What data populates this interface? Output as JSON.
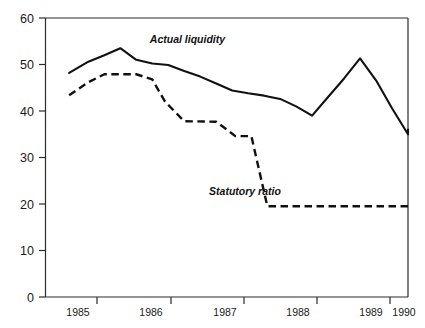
{
  "chart_data": {
    "type": "line",
    "title": "",
    "subtitle": "",
    "xlabel": "",
    "ylabel": "",
    "xlim": [
      1984.33,
      1990.0
    ],
    "ylim": [
      0,
      60
    ],
    "yticks": [
      0,
      10,
      20,
      30,
      40,
      50,
      60
    ],
    "ytick_labels": [
      "0",
      "10",
      "20",
      "30",
      "40",
      "50",
      "60"
    ],
    "xticks": [
      1985,
      1986,
      1987,
      1988,
      1989,
      1990
    ],
    "xtick_labels": [
      "1985",
      "1986",
      "1987",
      "1988",
      "1989",
      "1990"
    ],
    "grid": false,
    "legend_position": "inline-annotation",
    "series": [
      {
        "name": "Actual liquidity",
        "style": "solid",
        "color": "#111111",
        "annotation": "Actual liquidity",
        "annotation_x": 1986.55,
        "annotation_y": 54.6,
        "x": [
          1984.7,
          1985.0,
          1985.25,
          1985.5,
          1985.75,
          1986.0,
          1986.25,
          1986.5,
          1986.75,
          1987.0,
          1987.25,
          1987.5,
          1987.75,
          1988.0,
          1988.25,
          1988.5,
          1988.75,
          1989.0,
          1989.25,
          1989.5,
          1989.75,
          1990.0
        ],
        "y": [
          48.2,
          50.6,
          52.0,
          53.5,
          51.0,
          50.2,
          49.9,
          48.6,
          47.4,
          45.9,
          44.4,
          43.8,
          43.3,
          42.6,
          41.0,
          39.0,
          43.0,
          47.0,
          51.3,
          46.6,
          40.6,
          35.0
        ]
      },
      {
        "name": "Statutory ratio",
        "style": "dashed",
        "color": "#111111",
        "annotation": "Statutory ratio",
        "annotation_x": 1987.45,
        "annotation_y": 21.9,
        "x": [
          1984.7,
          1985.0,
          1985.25,
          1985.75,
          1986.0,
          1986.2,
          1986.5,
          1987.0,
          1987.3,
          1987.55,
          1987.8,
          1988.0,
          1988.5,
          1989.0,
          1989.5,
          1990.0
        ],
        "y": [
          43.4,
          46.2,
          47.9,
          47.9,
          46.8,
          42.0,
          37.8,
          37.7,
          34.6,
          34.6,
          19.5,
          19.5,
          19.5,
          19.5,
          19.5,
          19.5
        ]
      }
    ],
    "extra_points": {
      "solid_tail_x": [
        1989.75,
        1990.0
      ],
      "solid_tail_y": [
        35.0,
        36.0
      ]
    },
    "annotations": [
      {
        "text": "Actual liquidity",
        "x": 1986.55,
        "y": 54.6
      },
      {
        "text": "Statutory ratio",
        "x": 1987.45,
        "y": 21.9
      }
    ]
  },
  "axis": {
    "y_tick_0": "0",
    "y_tick_10": "10",
    "y_tick_20": "20",
    "y_tick_30": "30",
    "y_tick_40": "40",
    "y_tick_50": "50",
    "y_tick_60": "60",
    "x_tick_1985": "1985",
    "x_tick_1986": "1986",
    "x_tick_1987": "1987",
    "x_tick_1988": "1988",
    "x_tick_1989": "1989",
    "x_tick_1990": "1990"
  },
  "labels": {
    "actual_liquidity": "Actual liquidity",
    "statutory_ratio": "Statutory ratio"
  }
}
